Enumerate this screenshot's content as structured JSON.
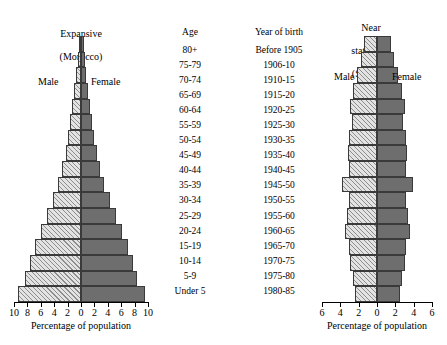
{
  "chart_data": {
    "type": "bar",
    "chart_kind": "population-pyramid",
    "title": "",
    "xlabel": "Percentage of population",
    "ylabel": "Age",
    "grid": false,
    "legend_position": "inline",
    "panels": [
      {
        "name": "left-pyramid",
        "title": "Expansive\n(Morocco)",
        "title_line1": "Expansive",
        "title_line2": "(Morocco)",
        "male_label": "Male",
        "female_label": "Female",
        "xlabel": "Percentage of population",
        "xlim": [
          -10,
          10
        ],
        "xticks": [
          10,
          8,
          6,
          4,
          2,
          0,
          2,
          4,
          6,
          8,
          10
        ],
        "categories": [
          "80+",
          "75-79",
          "70-74",
          "65-69",
          "60-64",
          "55-59",
          "50-54",
          "45-49",
          "40-44",
          "35-39",
          "30-34",
          "25-29",
          "20-24",
          "15-19",
          "10-14",
          "5-9",
          "Under 5"
        ],
        "series": [
          {
            "name": "Male",
            "values": [
              0.35,
              0.5,
              0.75,
              1.0,
              1.3,
              1.6,
              1.9,
              2.3,
              2.8,
              3.4,
              4.2,
              5.1,
              6.0,
              6.9,
              7.6,
              8.3,
              9.4
            ]
          },
          {
            "name": "Female",
            "values": [
              0.4,
              0.55,
              0.8,
              1.05,
              1.35,
              1.65,
              1.95,
              2.4,
              2.9,
              3.5,
              4.3,
              5.2,
              6.1,
              7.0,
              7.7,
              8.4,
              9.5
            ]
          }
        ]
      },
      {
        "name": "right-pyramid",
        "title": "Near\nstationary\n(Sweden)",
        "title_line1": "Near",
        "title_line2": "stationary",
        "title_line3": "(Sweden)",
        "male_label": "Male",
        "female_label": "Female",
        "xlabel": "Percentage of population",
        "xlim": [
          -6,
          6
        ],
        "xticks": [
          6,
          4,
          2,
          0,
          2,
          4,
          6
        ],
        "categories": [
          "80+",
          "75-79",
          "70-74",
          "65-69",
          "60-64",
          "55-59",
          "50-54",
          "45-49",
          "40-44",
          "35-39",
          "30-34",
          "25-29",
          "20-24",
          "15-19",
          "10-14",
          "5-9",
          "Under 5"
        ],
        "series": [
          {
            "name": "Male",
            "values": [
              1.4,
              1.7,
              2.2,
              2.6,
              3.0,
              2.7,
              3.1,
              3.2,
              3.1,
              3.8,
              3.1,
              3.3,
              3.5,
              3.1,
              2.9,
              2.6,
              2.4
            ]
          },
          {
            "name": "Female",
            "values": [
              1.5,
              1.8,
              2.3,
              2.7,
              3.1,
              2.8,
              3.2,
              3.3,
              3.2,
              3.9,
              3.2,
              3.4,
              3.6,
              3.2,
              3.0,
              2.7,
              2.5
            ]
          }
        ]
      }
    ],
    "center_columns": {
      "age": {
        "header": "Age",
        "values": [
          "80+",
          "75-79",
          "70-74",
          "65-69",
          "60-64",
          "55-59",
          "50-54",
          "45-49",
          "40-44",
          "35-39",
          "30-34",
          "25-29",
          "20-24",
          "15-19",
          "10-14",
          "5-9",
          "Under 5"
        ]
      },
      "year_of_birth": {
        "header": "Year of birth",
        "values": [
          "Before 1905",
          "1906-10",
          "1910-15",
          "1915-20",
          "1920-25",
          "1925-30",
          "1930-35",
          "1935-40",
          "1940-45",
          "1945-50",
          "1950-55",
          "1955-60",
          "1960-65",
          "1965-70",
          "1970-75",
          "1975-80",
          "1980-85"
        ]
      }
    },
    "colors": {
      "male_fill": "#e3e3e3",
      "male_hatch": "#8d8d8d",
      "female_fill": "#6e6e6e",
      "bar_outline": "#3a3a3a",
      "axis": "#000000",
      "background": "#ffffff"
    }
  }
}
